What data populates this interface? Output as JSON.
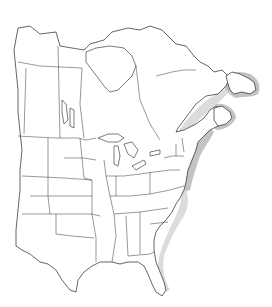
{
  "map": {
    "title": "",
    "region": "Eastern North America",
    "description": "Outline map of central/eastern Canada and the United States with state and province borders; a gray shaded band marks a range along the Atlantic coast from Newfoundland and the Gulf of St. Lawrence south to the Carolinas, with lighter shading continuing to Florida.",
    "colors": {
      "background": "#ffffff",
      "outline": "#222222",
      "range_shade": "#b8b8b8",
      "range_shade_light": "#d6d6d6"
    },
    "legend": []
  }
}
